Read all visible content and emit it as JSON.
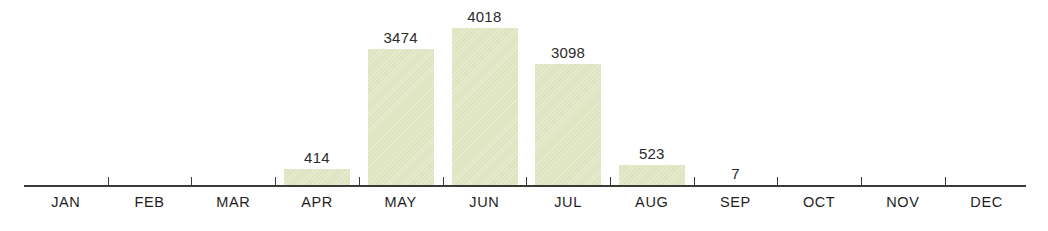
{
  "chart_data": {
    "type": "bar",
    "title": "",
    "subtitle": "",
    "xlabel": "",
    "ylabel": "",
    "categories": [
      "JAN",
      "FEB",
      "MAR",
      "APR",
      "MAY",
      "JUN",
      "JUL",
      "AUG",
      "SEP",
      "OCT",
      "NOV",
      "DEC"
    ],
    "values": [
      0,
      0,
      0,
      414,
      3474,
      4018,
      3098,
      523,
      7,
      0,
      0,
      0
    ],
    "value_labels": [
      "",
      "",
      "",
      "414",
      "3474",
      "4018",
      "3098",
      "523",
      "7",
      "",
      "",
      ""
    ],
    "ylim": [
      0,
      4018
    ],
    "grid": false,
    "legend": false,
    "legend_position": "none",
    "bar_color": "#dde4bf",
    "axis_color": "#3a3a38",
    "text_color": "#1e1e1e",
    "background": "#ffffff"
  },
  "axis": {
    "tick_count": 11,
    "baseline_visible": true
  }
}
